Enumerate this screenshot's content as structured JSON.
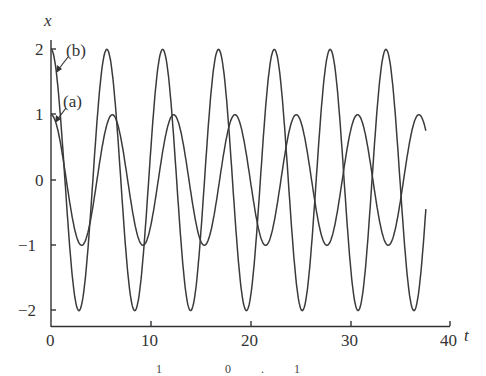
{
  "chart_data": {
    "type": "line",
    "title": "",
    "xlabel": "t",
    "ylabel": "x",
    "xlim": [
      0,
      40
    ],
    "ylim": [
      -2,
      2
    ],
    "xticks": [
      0,
      10,
      20,
      30,
      40
    ],
    "yticks": [
      -2,
      -1,
      0,
      1,
      2
    ],
    "xtick_labels": [
      "0",
      "10",
      "20",
      "30",
      "40"
    ],
    "ytick_labels": [
      "−2",
      "−1",
      "0",
      "1",
      "2"
    ],
    "grid": false,
    "legend": "annotations",
    "series": [
      {
        "name": "(a)",
        "description": "oscillation with initial value 1, amplitude 1, period about 6.15",
        "amplitude": 1,
        "period": 6.15,
        "t_end": 37.6,
        "x": [
          0,
          1.5,
          3.1,
          4.6,
          6.15,
          7.7,
          9.2,
          10.8,
          12.3,
          13.8,
          15.4,
          16.9,
          18.45,
          20.0,
          21.5,
          23.1,
          24.6,
          26.1,
          27.7,
          29.2,
          30.75,
          32.3,
          33.8,
          35.4,
          36.9,
          37.6
        ],
        "values": [
          1,
          0,
          -1,
          0,
          1,
          0,
          -1,
          0,
          1,
          0,
          -1,
          0,
          1,
          0,
          -1,
          0,
          1,
          0,
          -1,
          0,
          1,
          0,
          -1,
          0,
          1,
          0.9
        ]
      },
      {
        "name": "(b)",
        "description": "oscillation with initial value 2, amplitude 2, period about 5.6",
        "amplitude": 2,
        "period": 5.6,
        "t_end": 37.6,
        "x": [
          0,
          1.4,
          2.8,
          4.2,
          5.6,
          7.0,
          8.4,
          9.8,
          11.2,
          12.6,
          14.0,
          15.4,
          16.8,
          18.2,
          19.6,
          21.0,
          22.4,
          23.8,
          25.2,
          26.6,
          28.0,
          29.4,
          30.8,
          32.2,
          33.6,
          35.0,
          36.4,
          37.6
        ],
        "values": [
          2,
          0,
          -2,
          0,
          2,
          0,
          -2,
          0,
          2,
          0,
          -2,
          0,
          2,
          0,
          -2,
          0,
          2,
          0,
          -2,
          0,
          2,
          0,
          -2,
          0,
          2,
          0,
          -2,
          0.3
        ]
      }
    ],
    "annotations": [
      {
        "text": "(b)",
        "points_to": "series b at t≈0"
      },
      {
        "text": "(a)",
        "points_to": "series a at t≈0"
      }
    ]
  },
  "labels": {
    "y_axis": "x",
    "x_axis": "t",
    "annotation_a": "(a)",
    "annotation_b": "(b)",
    "tick_x0": "0",
    "tick_x10": "10",
    "tick_x20": "20",
    "tick_x30": "30",
    "tick_x40": "40",
    "tick_y2": "2",
    "tick_y1": "1",
    "tick_y0": "0",
    "tick_ym1": "−1",
    "tick_ym2": "−2"
  },
  "caption": "1   0.1"
}
